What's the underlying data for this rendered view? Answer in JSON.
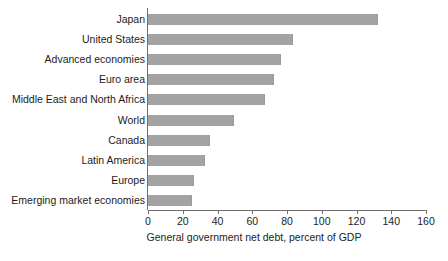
{
  "chart_data": {
    "type": "bar",
    "orientation": "horizontal",
    "title": "",
    "xlabel": "General government net debt, percent of GDP",
    "ylabel": "",
    "xlim": [
      0,
      160
    ],
    "xticks": [
      0,
      20,
      40,
      60,
      80,
      100,
      120,
      140,
      160
    ],
    "grid": false,
    "legend": null,
    "bar_color": "#a3a3a3",
    "axis_color": "#6f6f6f",
    "categories": [
      "Japan",
      "United States",
      "Advanced economies",
      "Euro area",
      "Middle East and North Africa",
      "World",
      "Canada",
      "Latin America",
      "Europe",
      "Emerging market economies"
    ],
    "values": [
      132,
      83,
      76,
      72,
      67,
      49,
      35,
      32,
      26,
      25
    ]
  }
}
